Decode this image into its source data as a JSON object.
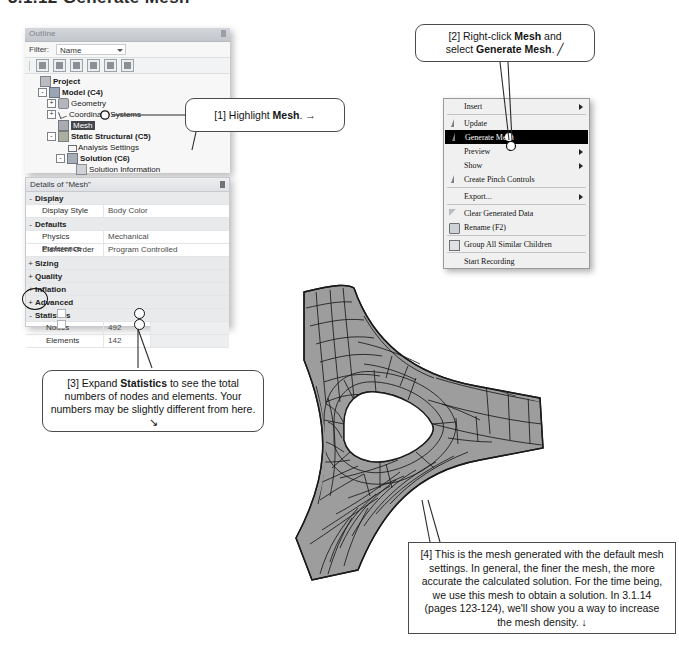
{
  "section": {
    "title": "3.1.12  Generate Mesh"
  },
  "outline": {
    "title": "Outline",
    "filter_label": "Filter:",
    "filter_value": "Name",
    "toolbar_icons": [
      "outline-refresh-icon",
      "outline-expand-icon",
      "outline-preview-icon",
      "outline-expand-all-icon",
      "outline-collapse-icon",
      "outline-sort-icon"
    ],
    "tree": [
      {
        "label": "Project",
        "depth": 0,
        "expander": "",
        "icon": "project-icon",
        "bold": true,
        "selected": false
      },
      {
        "label": "Model (C4)",
        "depth": 1,
        "expander": "-",
        "icon": "model-icon",
        "bold": true,
        "selected": false
      },
      {
        "label": "Geometry",
        "depth": 2,
        "expander": "+",
        "icon": "geometry-icon",
        "bold": false,
        "selected": false
      },
      {
        "label": "Coordinate Systems",
        "depth": 2,
        "expander": "+",
        "icon": "coordinate-systems-icon",
        "bold": false,
        "selected": false
      },
      {
        "label": "Mesh",
        "depth": 2,
        "expander": "",
        "icon": "mesh-icon",
        "bold": false,
        "selected": true
      },
      {
        "label": "Static Structural (C5)",
        "depth": 2,
        "expander": "-",
        "icon": "static-structural-icon",
        "bold": true,
        "selected": false
      },
      {
        "label": "Analysis Settings",
        "depth": 3,
        "expander": "",
        "icon": "analysis-settings-icon",
        "bold": false,
        "selected": false
      },
      {
        "label": "Solution (C6)",
        "depth": 3,
        "expander": "-",
        "icon": "solution-icon",
        "bold": true,
        "selected": false
      },
      {
        "label": "Solution Information",
        "depth": 4,
        "expander": "",
        "icon": "solution-information-icon",
        "bold": false,
        "selected": false
      }
    ]
  },
  "details": {
    "title": "Details of \"Mesh\"",
    "rows": [
      {
        "kind": "group",
        "expander": "-",
        "label": "Display",
        "value": ""
      },
      {
        "kind": "prop",
        "label": "Display Style",
        "value": "Body Color"
      },
      {
        "kind": "group",
        "expander": "-",
        "label": "Defaults",
        "value": ""
      },
      {
        "kind": "prop",
        "label": "Physics Preference",
        "value": "Mechanical"
      },
      {
        "kind": "prop",
        "label": "Element Order",
        "value": "Program Controlled"
      },
      {
        "kind": "group",
        "expander": "+",
        "label": "Sizing",
        "value": ""
      },
      {
        "kind": "group",
        "expander": "+",
        "label": "Quality",
        "value": ""
      },
      {
        "kind": "group",
        "expander": "+",
        "label": "Inflation",
        "value": ""
      },
      {
        "kind": "group",
        "expander": "+",
        "label": "Advanced",
        "value": ""
      },
      {
        "kind": "group",
        "expander": "-",
        "label": "Statistics",
        "value": ""
      },
      {
        "kind": "stat",
        "label": "Nodes",
        "value": "492"
      },
      {
        "kind": "stat",
        "label": "Elements",
        "value": "142"
      }
    ]
  },
  "context_menu": {
    "items": [
      {
        "label": "Insert",
        "icon": "none",
        "submenu": true,
        "selected": false,
        "sep_after": true
      },
      {
        "label": "Update",
        "icon": "lightning-icon",
        "submenu": false,
        "selected": false,
        "sep_after": false
      },
      {
        "label": "Generate Mesh",
        "icon": "lightning-icon",
        "submenu": false,
        "selected": true,
        "sep_after": false
      },
      {
        "label": "Preview",
        "icon": "none",
        "submenu": true,
        "selected": false,
        "sep_after": false
      },
      {
        "label": "Show",
        "icon": "none",
        "submenu": true,
        "selected": false,
        "sep_after": false
      },
      {
        "label": "Create Pinch Controls",
        "icon": "lightning-icon",
        "submenu": false,
        "selected": false,
        "sep_after": true
      },
      {
        "label": "Export...",
        "icon": "none",
        "submenu": true,
        "selected": false,
        "sep_after": true
      },
      {
        "label": "Clear Generated Data",
        "icon": "triangle-icon",
        "submenu": false,
        "selected": false,
        "sep_after": false
      },
      {
        "label": "Rename (F2)",
        "icon": "rename-icon",
        "submenu": false,
        "selected": false,
        "sep_after": true
      },
      {
        "label": "Group All Similar Children",
        "icon": "box-icon",
        "submenu": false,
        "selected": false,
        "sep_after": true
      },
      {
        "label": "Start Recording",
        "icon": "none",
        "submenu": false,
        "selected": false,
        "sep_after": false
      }
    ]
  },
  "callouts": {
    "one": {
      "pre": "[1] Highlight ",
      "bold": "Mesh",
      "post": ". ",
      "arrow": "→"
    },
    "two": {
      "line1_pre": "[2] Right-click ",
      "line1_bold": "Mesh",
      "line1_post": " and",
      "line2_pre": "select ",
      "line2_bold": "Generate Mesh",
      "line2_post": ". ",
      "arrow": "╱"
    },
    "three": {
      "pre": "[3] Expand ",
      "bold": "Statistics",
      "post": " to see the total numbers of nodes and elements. Your numbers may be slightly different from here. ",
      "arrow": "↘"
    },
    "four": {
      "text": "[4] This is the mesh generated with the default mesh settings.  In general, the finer the mesh, the more accurate the calculated solution.  For the time being, we use this mesh to obtain a solution.  In 3.1.14 (pages 123-124), we'll show you a way to increase the mesh density. ",
      "arrow": "↓"
    }
  },
  "mesh": {
    "fill_color": "#9d9d9d",
    "edge_color": "#1a1a1a",
    "description": "tri-lobed plate finite-element mesh with central triangular hole"
  },
  "colors": {
    "panel_bg": "#f2f3f4",
    "titlebar": "#d3d6da",
    "selection": "#43474b",
    "menu_bg": "#f0f0f0",
    "menu_selected": "#000000",
    "mesh_fill": "#9d9d9d"
  }
}
